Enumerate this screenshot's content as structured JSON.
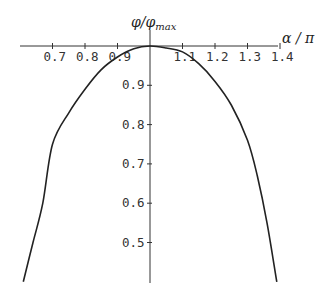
{
  "chart_data": {
    "type": "line",
    "title": "",
    "xlabel": "α / π",
    "ylabel": "φ/φmax",
    "ylabel_main": "φ/φ",
    "ylabel_sub": "max",
    "xlim": [
      0.6,
      1.4
    ],
    "ylim": [
      0.4,
      1.0
    ],
    "x_axis_crosses_y_at": 1.0,
    "y_axis_crosses_x_at": 1.0,
    "grid": false,
    "legend": null,
    "x_ticks": [
      0.7,
      0.8,
      0.9,
      1.1,
      1.2,
      1.3,
      1.4
    ],
    "x_tick_labels": [
      "0.7",
      "0.8",
      "0.9",
      "1.1",
      "1.2",
      "1.3",
      "1.4"
    ],
    "y_ticks": [
      0.5,
      0.6,
      0.7,
      0.8,
      0.9
    ],
    "y_tick_labels": [
      "0.5",
      "0.6",
      "0.7",
      "0.8",
      "0.9"
    ],
    "series": [
      {
        "name": "φ/φmax",
        "x": [
          0.61,
          0.64,
          0.67,
          0.7,
          0.75,
          0.8,
          0.85,
          0.9,
          0.95,
          1.0,
          1.05,
          1.1,
          1.15,
          1.2,
          1.25,
          1.3,
          1.33,
          1.36,
          1.39
        ],
        "values": [
          0.4,
          0.5,
          0.6,
          0.75,
          0.83,
          0.89,
          0.94,
          0.972,
          0.993,
          1.0,
          0.995,
          0.985,
          0.955,
          0.91,
          0.85,
          0.76,
          0.67,
          0.55,
          0.4
        ]
      }
    ]
  }
}
